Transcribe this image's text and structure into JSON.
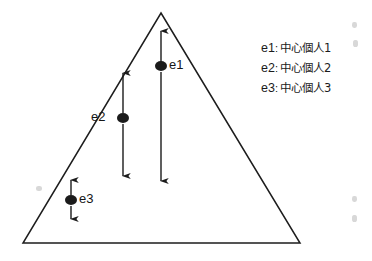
{
  "figure": {
    "type": "diagram",
    "background_color": "#ffffff",
    "ink_color": "#1b1b1b",
    "shape": {
      "name": "triangle",
      "apex": [
        161,
        13
      ],
      "bottom_left": [
        23,
        243
      ],
      "bottom_right": [
        300,
        243
      ]
    }
  },
  "nodes": [
    {
      "id": "e1",
      "label": "e1",
      "label_side": "right",
      "dot": [
        161,
        66
      ],
      "dot_rx": 6,
      "dot_ry": 5,
      "arrows": [
        {
          "name": "e1-up-arrow",
          "direction": "up",
          "from": [
            161,
            62
          ],
          "to": [
            161,
            31
          ]
        },
        {
          "name": "e1-down-arrow",
          "direction": "down",
          "from": [
            161,
            72
          ],
          "to": [
            161,
            181
          ]
        }
      ]
    },
    {
      "id": "e2",
      "label": "e2",
      "label_side": "left",
      "dot": [
        123,
        118
      ],
      "dot_rx": 6,
      "dot_ry": 5,
      "arrows": [
        {
          "name": "e2-up-arrow",
          "direction": "up",
          "from": [
            123,
            113
          ],
          "to": [
            123,
            73
          ]
        },
        {
          "name": "e2-down-arrow",
          "direction": "down",
          "from": [
            123,
            124
          ],
          "to": [
            123,
            176
          ]
        }
      ]
    },
    {
      "id": "e3",
      "label": "e3",
      "label_side": "right",
      "dot": [
        71,
        200
      ],
      "dot_rx": 6,
      "dot_ry": 5,
      "arrows": [
        {
          "name": "e3-up-arrow",
          "direction": "up",
          "from": [
            71,
            195
          ],
          "to": [
            71,
            180
          ]
        },
        {
          "name": "e3-down-arrow",
          "direction": "down",
          "from": [
            71,
            206
          ],
          "to": [
            71,
            219
          ]
        }
      ]
    }
  ],
  "legend": {
    "entries": [
      {
        "key": "e1",
        "separator": ":",
        "text": "中心個人1"
      },
      {
        "key": "e2",
        "separator": ":",
        "text": "中心個人2"
      },
      {
        "key": "e3",
        "separator": ":",
        "text": "中心個人3"
      }
    ]
  }
}
